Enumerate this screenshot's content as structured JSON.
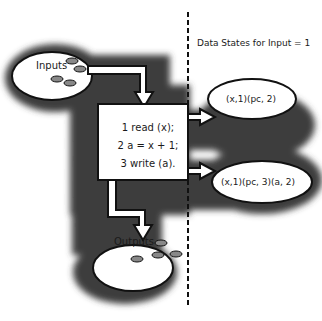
{
  "diagram": {
    "header": "Data States for Input = 1",
    "inputs": {
      "label": "Inputs"
    },
    "outputs": {
      "label": "Outputs"
    },
    "program": {
      "lines": [
        "1 read (x);",
        "2 a = x + 1;",
        "3 write (a)."
      ]
    },
    "states": [
      {
        "label": "(x,1)(pc, 2)"
      },
      {
        "label": "(x,1)(pc, 3)(a, 2)"
      }
    ],
    "colors": {
      "shadow": "#2b2b2b",
      "shape_fill": "#ffffff",
      "outline": "#111111",
      "token_fill": "#888888"
    }
  }
}
